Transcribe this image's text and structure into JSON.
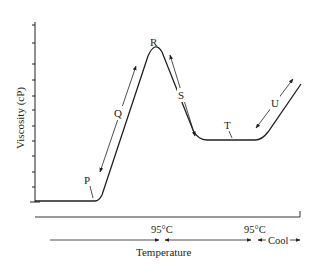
{
  "diagram": {
    "type": "rapid-visco-analyzer pasting curve",
    "y_axis": {
      "label": "Viscosity (cP)",
      "ticks": 12
    },
    "x_axis": {
      "label": "Temperature"
    },
    "points": [
      {
        "id": "P",
        "label": "P",
        "meaning": "pasting onset"
      },
      {
        "id": "Q",
        "label": "Q",
        "meaning": "viscosity rise"
      },
      {
        "id": "R",
        "label": "R",
        "meaning": "peak viscosity"
      },
      {
        "id": "S",
        "label": "S",
        "meaning": "breakdown"
      },
      {
        "id": "T",
        "label": "T",
        "meaning": "trough"
      },
      {
        "id": "U",
        "label": "U",
        "meaning": "setback"
      }
    ],
    "temperature_markers": [
      {
        "label": "95°C",
        "position": "end of heating"
      },
      {
        "label": "95°C",
        "position": "end of hold"
      }
    ],
    "phase_labels": {
      "cool": "Cool"
    }
  }
}
